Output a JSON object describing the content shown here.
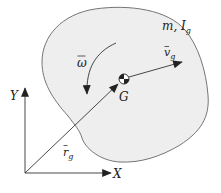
{
  "diagram": {
    "type": "rigid-body kinematics",
    "colors": {
      "body_fill": "#eeeeee",
      "outline": "#555555",
      "arrow": "#222222",
      "background": "#ffffff"
    },
    "labels": {
      "mass_inertia": "m, I",
      "mass_inertia_sub": "g",
      "velocity": "v",
      "velocity_sub": "g",
      "velocity_bar": "‾",
      "angular_velocity": "ω",
      "center_of_mass": "G",
      "position": "r",
      "position_sub": "g",
      "y_axis": "Y",
      "x_axis": "X"
    },
    "elements": [
      {
        "name": "rigid-body",
        "description": "irregular blob shape with mass m and inertia I_g"
      },
      {
        "name": "center-of-mass-symbol",
        "at": "G"
      },
      {
        "name": "velocity-vector",
        "label": "v_g",
        "from": "G"
      },
      {
        "name": "angular-velocity-arc",
        "label": "ω",
        "direction": "counterclockwise"
      },
      {
        "name": "position-vector",
        "label": "r_g",
        "from": "origin",
        "to": "G"
      },
      {
        "name": "y-axis",
        "label": "Y"
      },
      {
        "name": "x-axis",
        "label": "X"
      }
    ]
  }
}
